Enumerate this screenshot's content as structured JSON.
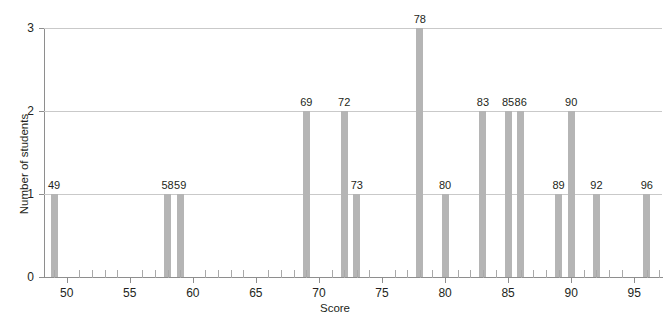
{
  "chart_data": {
    "type": "bar",
    "title": "",
    "xlabel": "Score",
    "ylabel": "Number of students",
    "xlim": [
      48.2,
      97.2
    ],
    "ylim": [
      0,
      3
    ],
    "grid": true,
    "legend": "none",
    "bar_color": "#b5b5b5",
    "gridline_color": "#c9c9c9",
    "axis_color": "#8e8e8e",
    "text_color": "#231f20",
    "x_tick_step_minor": 1,
    "x_tick_step_major": 5,
    "y_ticks": [
      "0",
      "1",
      "2",
      "3"
    ],
    "y_tick_values": [
      0,
      1,
      2,
      3
    ],
    "x_ticks": [
      "50",
      "55",
      "60",
      "65",
      "70",
      "75",
      "80",
      "85",
      "90",
      "95"
    ],
    "x_tick_values": [
      50,
      55,
      60,
      65,
      70,
      75,
      80,
      85,
      90,
      95
    ],
    "categories": [
      49,
      58,
      59,
      69,
      72,
      73,
      78,
      80,
      83,
      85,
      86,
      89,
      90,
      92,
      96
    ],
    "values": [
      1,
      1,
      1,
      2,
      2,
      1,
      3,
      1,
      2,
      2,
      2,
      1,
      2,
      1,
      1
    ],
    "point_labels": [
      "49",
      "58",
      "59",
      "69",
      "72",
      "73",
      "78",
      "80",
      "83",
      "85",
      "86",
      "89",
      "90",
      "92",
      "96"
    ],
    "points": [
      {
        "score": 49,
        "count": 1,
        "label": "49"
      },
      {
        "score": 58,
        "count": 1,
        "label": "58"
      },
      {
        "score": 59,
        "count": 1,
        "label": "59"
      },
      {
        "score": 69,
        "count": 2,
        "label": "69"
      },
      {
        "score": 72,
        "count": 2,
        "label": "72"
      },
      {
        "score": 73,
        "count": 1,
        "label": "73"
      },
      {
        "score": 78,
        "count": 3,
        "label": "78"
      },
      {
        "score": 80,
        "count": 1,
        "label": "80"
      },
      {
        "score": 83,
        "count": 2,
        "label": "83"
      },
      {
        "score": 85,
        "count": 2,
        "label": "85"
      },
      {
        "score": 86,
        "count": 2,
        "label": "86"
      },
      {
        "score": 89,
        "count": 1,
        "label": "89"
      },
      {
        "score": 90,
        "count": 2,
        "label": "90"
      },
      {
        "score": 92,
        "count": 1,
        "label": "92"
      },
      {
        "score": 96,
        "count": 1,
        "label": "96"
      }
    ]
  }
}
